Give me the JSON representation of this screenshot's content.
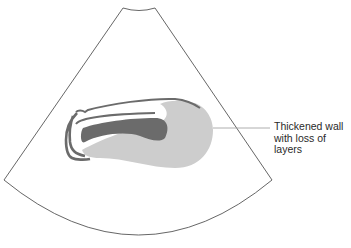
{
  "figure": {
    "type": "ultrasound-sector-schematic",
    "colors": {
      "background": "#ffffff",
      "sector_outline": "#555555",
      "wall_dark": "#6b6b6b",
      "thickened_wall": "#cdcdcd",
      "leader_line": "#9a9a9a",
      "label_text": "#2a2a2a"
    }
  },
  "annotations": [
    {
      "id": "thickened-wall",
      "text": "Thickened wall\nwith loss of\nlayers"
    }
  ]
}
